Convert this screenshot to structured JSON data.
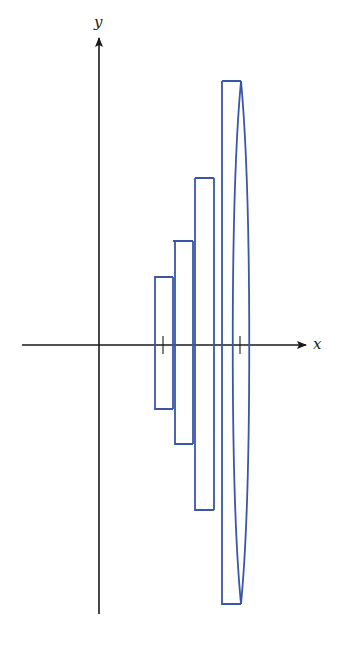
{
  "diagram": {
    "type": "solid-of-revolution-approximation",
    "axes": {
      "x_label": "x",
      "y_label": "y"
    },
    "colors": {
      "axis": "#1a1a1a",
      "shape": "#3a56a8",
      "background": "#ffffff"
    },
    "shapes": [
      {
        "name": "disk-1",
        "kind": "cylinder"
      },
      {
        "name": "disk-2",
        "kind": "cylinder"
      },
      {
        "name": "disk-3",
        "kind": "cylinder"
      },
      {
        "name": "disk-4",
        "kind": "cylinder-with-elliptical-face"
      }
    ],
    "ticks": [
      {
        "name": "tick-a"
      },
      {
        "name": "tick-b"
      }
    ]
  }
}
